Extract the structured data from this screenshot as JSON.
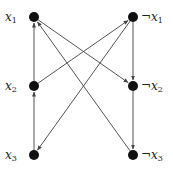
{
  "diagram": {
    "type": "implication-graph",
    "colors": {
      "node": "#111111",
      "edge": "#555555",
      "background": "#ffffff",
      "label": "#222222"
    },
    "nodes": [
      {
        "id": "x1",
        "neg": "",
        "var": "x",
        "sub": "1",
        "cx": 34,
        "cy": 17,
        "label_x": 5,
        "label_y": 11,
        "side": "left"
      },
      {
        "id": "nx1",
        "neg": "¬",
        "var": "x",
        "sub": "1",
        "cx": 133,
        "cy": 17,
        "label_x": 142,
        "label_y": 11,
        "side": "right"
      },
      {
        "id": "x2",
        "neg": "",
        "var": "x",
        "sub": "2",
        "cx": 34,
        "cy": 86,
        "label_x": 5,
        "label_y": 80,
        "side": "left"
      },
      {
        "id": "nx2",
        "neg": "¬",
        "var": "x",
        "sub": "2",
        "cx": 133,
        "cy": 86,
        "label_x": 142,
        "label_y": 80,
        "side": "right"
      },
      {
        "id": "x3",
        "neg": "",
        "var": "x",
        "sub": "3",
        "cx": 34,
        "cy": 155,
        "label_x": 5,
        "label_y": 149,
        "side": "left"
      },
      {
        "id": "nx3",
        "neg": "¬",
        "var": "x",
        "sub": "3",
        "cx": 133,
        "cy": 155,
        "label_x": 142,
        "label_y": 149,
        "side": "right"
      }
    ],
    "edges": [
      {
        "from": "x3",
        "to": "x2"
      },
      {
        "from": "x2",
        "to": "x1"
      },
      {
        "from": "x2",
        "to": "nx1"
      },
      {
        "from": "nx1",
        "to": "nx2"
      },
      {
        "from": "nx2",
        "to": "nx3"
      },
      {
        "from": "nx1",
        "to": "x3"
      },
      {
        "from": "x1",
        "to": "nx2"
      },
      {
        "from": "nx3",
        "to": "x1"
      }
    ]
  },
  "labels": {
    "x1": {
      "neg": "",
      "var": "x",
      "sub": "1"
    },
    "nx1": {
      "neg": "¬",
      "var": "x",
      "sub": "1"
    },
    "x2": {
      "neg": "",
      "var": "x",
      "sub": "2"
    },
    "nx2": {
      "neg": "¬",
      "var": "x",
      "sub": "2"
    },
    "x3": {
      "neg": "",
      "var": "x",
      "sub": "3"
    },
    "nx3": {
      "neg": "¬",
      "var": "x",
      "sub": "3"
    }
  }
}
